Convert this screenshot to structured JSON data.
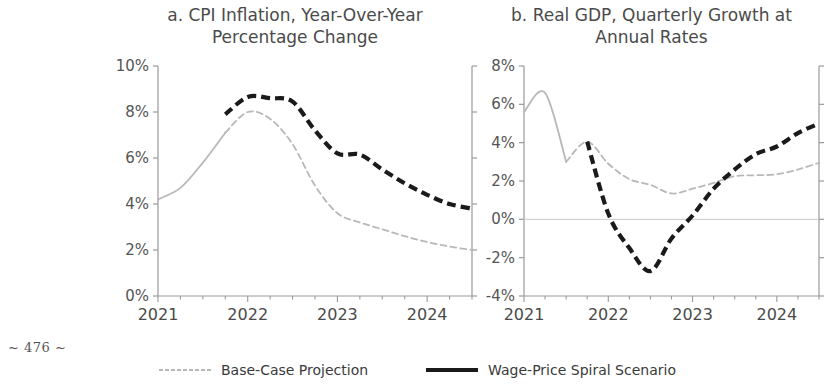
{
  "page_marker": "~ 476 ~",
  "legend": {
    "items": [
      {
        "label": "Base-Case Projection",
        "color": "#b8b8b8",
        "style": "thin-dashed",
        "name": "legend-base-case"
      },
      {
        "label": "Wage-Price Spiral Scenario",
        "color": "#1a1a1a",
        "style": "thick-dashed",
        "name": "legend-wage-price"
      }
    ]
  },
  "panels": {
    "left": {
      "title_line1": "a. CPI Inflation, Year-Over-Year",
      "title_line2": "Percentage Change"
    },
    "right": {
      "title_line1": "b. Real GDP, Quarterly Growth at",
      "title_line2": "Annual Rates"
    }
  },
  "chart_data": [
    {
      "panel": "a",
      "type": "line",
      "title": "a. CPI Inflation, Year-Over-Year Percentage Change",
      "xlabel": "",
      "ylabel": "",
      "xlim": [
        2021.0,
        2024.5
      ],
      "ylim": [
        0,
        10
      ],
      "yticks": [
        0,
        2,
        4,
        6,
        8,
        10
      ],
      "ytick_labels": [
        "0%",
        "2%",
        "4%",
        "6%",
        "8%",
        "10%"
      ],
      "xticks": [
        2021,
        2022,
        2023,
        2024
      ],
      "xtick_labels": [
        "2021",
        "2022",
        "2023",
        "2024"
      ],
      "xminor_step": 0.25,
      "grid": false,
      "legend_position": "below-figure",
      "series": [
        {
          "name": "Base-Case Projection",
          "color": "#b8b8b8",
          "history_end_x": 2021.75,
          "x": [
            2021.0,
            2021.25,
            2021.5,
            2021.75,
            2022.0,
            2022.25,
            2022.5,
            2022.75,
            2023.0,
            2023.25,
            2023.5,
            2023.75,
            2024.0,
            2024.25,
            2024.5
          ],
          "values": [
            4.2,
            4.7,
            5.8,
            7.1,
            8.0,
            7.7,
            6.6,
            4.8,
            3.6,
            3.2,
            2.9,
            2.6,
            2.35,
            2.15,
            2.0
          ]
        },
        {
          "name": "Wage-Price Spiral Scenario",
          "color": "#1a1a1a",
          "x": [
            2021.75,
            2022.0,
            2022.25,
            2022.5,
            2022.75,
            2023.0,
            2023.25,
            2023.5,
            2023.75,
            2024.0,
            2024.25,
            2024.5
          ],
          "values": [
            7.9,
            8.65,
            8.6,
            8.45,
            7.2,
            6.2,
            6.15,
            5.5,
            4.9,
            4.4,
            4.0,
            3.8
          ]
        }
      ]
    },
    {
      "panel": "b",
      "type": "line",
      "title": "b. Real GDP, Quarterly Growth at Annual Rates",
      "xlabel": "",
      "ylabel": "",
      "xlim": [
        2021.0,
        2024.5
      ],
      "ylim": [
        -4,
        8
      ],
      "yticks": [
        -4,
        -2,
        0,
        2,
        4,
        6,
        8
      ],
      "ytick_labels": [
        "-4%",
        "-2%",
        "0%",
        "2%",
        "4%",
        "6%",
        "8%"
      ],
      "xticks": [
        2021,
        2022,
        2023,
        2024
      ],
      "xtick_labels": [
        "2021",
        "2022",
        "2023",
        "2024"
      ],
      "xminor_step": 0.25,
      "grid": false,
      "zero_line": true,
      "legend_position": "below-figure",
      "series": [
        {
          "name": "Base-Case Projection",
          "color": "#b8b8b8",
          "history_end_x": 2021.5,
          "x": [
            2021.0,
            2021.25,
            2021.5,
            2021.75,
            2022.0,
            2022.25,
            2022.5,
            2022.75,
            2023.0,
            2023.25,
            2023.5,
            2023.75,
            2024.0,
            2024.25,
            2024.5
          ],
          "values": [
            5.6,
            6.6,
            3.0,
            4.05,
            2.9,
            2.1,
            1.8,
            1.35,
            1.6,
            1.9,
            2.25,
            2.3,
            2.35,
            2.6,
            2.95
          ]
        },
        {
          "name": "Wage-Price Spiral Scenario",
          "color": "#1a1a1a",
          "x": [
            2021.75,
            2022.0,
            2022.25,
            2022.5,
            2022.75,
            2023.0,
            2023.25,
            2023.5,
            2023.75,
            2024.0,
            2024.25,
            2024.5
          ],
          "values": [
            4.05,
            0.3,
            -1.5,
            -2.7,
            -1.0,
            0.2,
            1.6,
            2.6,
            3.4,
            3.8,
            4.5,
            5.0
          ]
        }
      ]
    }
  ]
}
